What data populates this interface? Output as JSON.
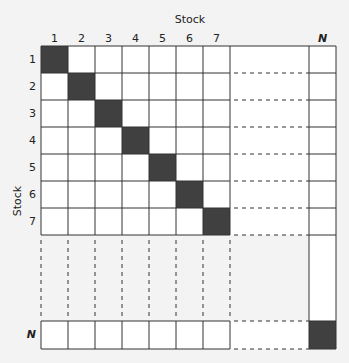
{
  "diagram": {
    "title_top": "Stock",
    "title_left": "Stock",
    "col_labels": [
      "1",
      "2",
      "3",
      "4",
      "5",
      "6",
      "7",
      "N"
    ],
    "row_labels": [
      "1",
      "2",
      "3",
      "4",
      "5",
      "6",
      "7",
      "N"
    ],
    "colors": {
      "diagonal_fill": "#404040",
      "cell_fill": "#ffffff",
      "grid_line": "#333333",
      "background": "#f3f3f3"
    }
  }
}
